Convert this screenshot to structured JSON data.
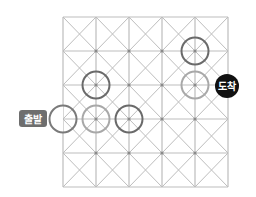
{
  "diagram": {
    "grid": {
      "columns": 5,
      "rows": 5,
      "x_lines": [
        63,
        96,
        129,
        162,
        195,
        228
      ],
      "y_lines": [
        17,
        51,
        85,
        119,
        153,
        187
      ],
      "line_color": "#bdbdbd",
      "dot_color": "#8a8a8a",
      "cell_diagonals": true
    },
    "circles": [
      {
        "col": 0,
        "row": 3,
        "color": "#7a7a7a",
        "role": "start"
      },
      {
        "col": 1,
        "row": 3,
        "color": "#a8a8a8"
      },
      {
        "col": 2,
        "row": 3,
        "color": "#6a6a6a"
      },
      {
        "col": 1,
        "row": 2,
        "color": "#6a6a6a"
      },
      {
        "col": 4,
        "row": 2,
        "color": "#a8a8a8"
      },
      {
        "col": 4,
        "row": 1,
        "color": "#6a6a6a"
      }
    ],
    "circle_radius": 13.5,
    "start_label": {
      "text": "출발",
      "bg": "#6e6e6e"
    },
    "end_label": {
      "text": "도착",
      "bg": "#111111"
    }
  }
}
